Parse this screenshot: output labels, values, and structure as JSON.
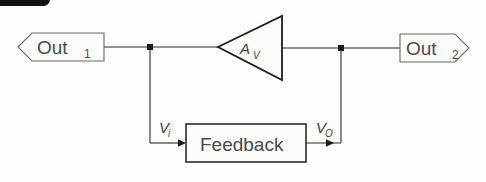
{
  "diagram": {
    "background_color": "#fdfdfb",
    "line_color": "#2b2b2b",
    "text_color": "#4a4a4a",
    "blocks": {
      "amplifier": {
        "label": "A",
        "subscript": "V",
        "shape": "triangle-right"
      },
      "feedback": {
        "label": "Feedback",
        "shape": "rectangle"
      }
    },
    "terminals": {
      "out1": {
        "label": "Out",
        "subscript": "1",
        "direction": "left-arrow"
      },
      "out2": {
        "label": "Out",
        "subscript": "2",
        "direction": "right-arrow"
      }
    },
    "signal_labels": {
      "vi": {
        "label": "V",
        "subscript": "i"
      },
      "vo": {
        "label": "V",
        "subscript": "O"
      }
    },
    "nodes": [
      {
        "name": "left-junction",
        "x": 150,
        "y": 47
      },
      {
        "name": "right-junction",
        "x": 341,
        "y": 48
      }
    ],
    "corner_marker": {
      "name": "top-left-black-bar",
      "color": "#111111"
    }
  }
}
